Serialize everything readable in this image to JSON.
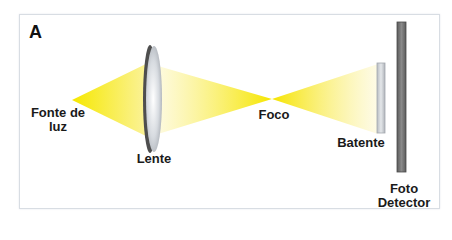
{
  "panel": {
    "letter": "A"
  },
  "labels": {
    "source_line1": "Fonte de",
    "source_line2": "luz",
    "lens": "Lente",
    "focus": "Foco",
    "stop": "Batente",
    "detector_line1": "Foto",
    "detector_line2": "Detector"
  },
  "colors": {
    "beam": "#f5e600",
    "lens_rim": "#555555",
    "lens_face": "#d8dde2",
    "stop": "#c9ccd0",
    "detector": "#7a7a7a",
    "frame": "#d8dde3"
  }
}
